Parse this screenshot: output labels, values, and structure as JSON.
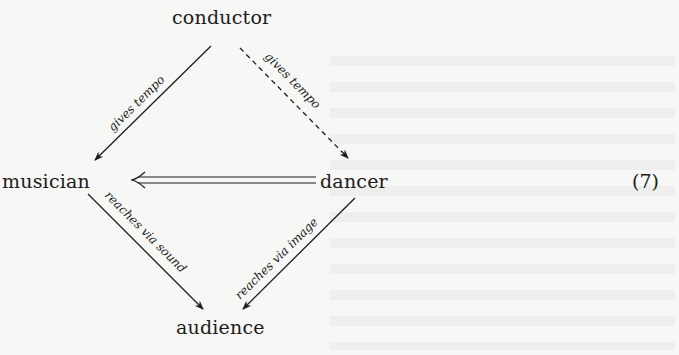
{
  "diagram": {
    "type": "commutative-diagram",
    "equation_number": "(7)",
    "nodes": {
      "conductor": "conductor",
      "musician": "musician",
      "dancer": "dancer",
      "audience": "audience"
    },
    "edges": [
      {
        "from": "conductor",
        "to": "musician",
        "label": "gives tempo",
        "style": "solid"
      },
      {
        "from": "conductor",
        "to": "dancer",
        "label": "gives tempo",
        "style": "dashed"
      },
      {
        "from": "dancer",
        "to": "musician",
        "label": "",
        "style": "double"
      },
      {
        "from": "musician",
        "to": "audience",
        "label": "reaches via sound",
        "style": "solid"
      },
      {
        "from": "dancer",
        "to": "audience",
        "label": "reaches via image",
        "style": "solid"
      }
    ],
    "colors": {
      "ink": "#1c1c1c",
      "paper": "#f7f7f5"
    }
  }
}
